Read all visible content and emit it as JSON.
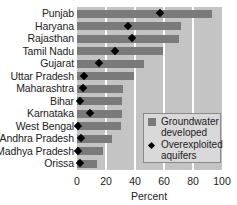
{
  "chart_data": {
    "type": "bar",
    "orientation": "horizontal",
    "title": "",
    "xlabel": "Percent",
    "ylabel": "",
    "xlim": [
      0,
      100
    ],
    "xticks": [
      "0",
      "20",
      "40",
      "60",
      "80",
      "100"
    ],
    "grid": true,
    "legend_position": "lower right",
    "categories": [
      "Punjab",
      "Haryana",
      "Rajasthan",
      "Tamil Nadu",
      "Gujarat",
      "Uttar Pradesh",
      "Maharashtra",
      "Bihar",
      "Karnataka",
      "West Bengal",
      "Andhra Pradesh",
      "Madhya Pradesh",
      "Orissa"
    ],
    "series": [
      {
        "name": "Groundwater developed",
        "marker": "bar",
        "values": [
          93,
          72,
          70,
          59,
          46,
          39,
          32,
          31,
          31,
          30,
          24,
          18,
          14
        ]
      },
      {
        "name": "Overexploited aquifers",
        "marker": "diamond",
        "values": [
          57,
          35,
          38,
          26,
          15,
          5,
          4,
          2,
          9,
          1,
          3,
          1,
          2
        ]
      }
    ]
  },
  "legend": {
    "items": [
      {
        "line1": "Groundwater",
        "line2": "developed"
      },
      {
        "line1": "Overexploited",
        "line2": "aquifers"
      }
    ]
  },
  "colors": {
    "bar": "#7a7a7a",
    "background": "#c4c4c4",
    "marker": "#000000"
  }
}
